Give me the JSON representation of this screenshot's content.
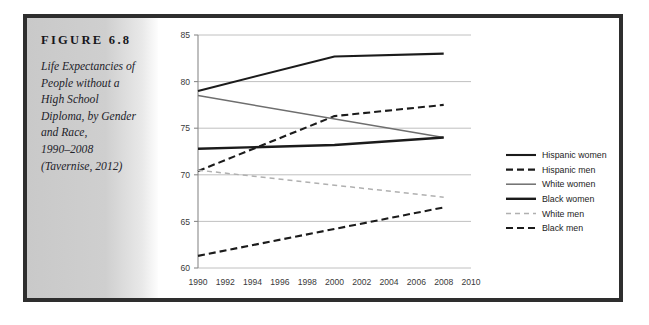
{
  "figure": {
    "label": "FIGURE 6.8",
    "caption_lines": [
      "Life Expectancies of",
      "People without a",
      "High School",
      "Diploma, by Gender",
      "and Race,",
      "1990–2008",
      "(Tavernise, 2012)"
    ]
  },
  "colors": {
    "frame": "#2e2e2e",
    "panel_grey": "#cbcbcb",
    "grid": "#b9b9b9",
    "axis": "#8a8a8a",
    "dark_line": "#1b1b1b",
    "mid_line": "#6e6e6e",
    "light_line": "#b0b0b0",
    "text": "#23232a"
  },
  "chart_data": {
    "type": "line",
    "xlabel": "",
    "ylabel": "",
    "xlim": [
      1990,
      2010
    ],
    "ylim": [
      60,
      85
    ],
    "grid": true,
    "legend_position": "right",
    "xticks": [
      1990,
      1992,
      1994,
      1996,
      1998,
      2000,
      2002,
      2004,
      2006,
      2008,
      2010
    ],
    "yticks": [
      60,
      65,
      70,
      75,
      80,
      85
    ],
    "series": [
      {
        "name": "Hispanic women",
        "style": "solid",
        "color": "#1b1b1b",
        "width": 2.1,
        "x": [
          1990,
          2000,
          2008
        ],
        "values": [
          79.0,
          82.7,
          83.0
        ]
      },
      {
        "name": "Hispanic men",
        "style": "dashed",
        "color": "#1b1b1b",
        "width": 2.1,
        "x": [
          1990,
          2000,
          2008
        ],
        "values": [
          70.4,
          76.3,
          77.5
        ]
      },
      {
        "name": "White women",
        "style": "solid",
        "color": "#6e6e6e",
        "width": 1.5,
        "x": [
          1990,
          2008
        ],
        "values": [
          78.5,
          74.0
        ]
      },
      {
        "name": "Black women",
        "style": "solid",
        "color": "#1b1b1b",
        "width": 2.4,
        "x": [
          1990,
          2000,
          2008
        ],
        "values": [
          72.8,
          73.2,
          74.0
        ]
      },
      {
        "name": "White men",
        "style": "dashed",
        "color": "#b0b0b0",
        "width": 1.5,
        "x": [
          1990,
          2008
        ],
        "values": [
          70.5,
          67.6
        ]
      },
      {
        "name": "Black men",
        "style": "dashed",
        "color": "#1b1b1b",
        "width": 2.1,
        "x": [
          1990,
          2008
        ],
        "values": [
          61.3,
          66.5
        ]
      }
    ]
  }
}
